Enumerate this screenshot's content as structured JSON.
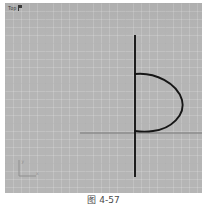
{
  "viewport": {
    "label": "Top",
    "label_marker_icon": "viewport-menu-marker-icon",
    "background_color": "#b5b5b5",
    "grid": {
      "visible": true,
      "minor_spacing_px": 8,
      "major_spacing_px": 40,
      "minor_color": "#c2c2c2",
      "major_color": "#a0a0a0"
    }
  },
  "axis_tripod": {
    "name": "world-axis-tripod",
    "x_axis_label": "x",
    "y_axis_label": "y",
    "color": "#8f8f8f"
  },
  "geometry": {
    "stroke_color": "#161616",
    "axis_line_color": "#8c8c8c",
    "vertical_line": {
      "name": "vertical-axis-line",
      "x": 130,
      "y_top": 32,
      "y_bottom": 174,
      "stroke_width": 1.9
    },
    "horizontal_line": {
      "name": "horizontal-construction-line",
      "y": 130,
      "x_left": 75,
      "x_right": 197,
      "stroke_width": 1.3
    },
    "profile_curve": {
      "name": "revolve-profile-arc",
      "description": "closed D-shaped arc bulging to the right of the axis",
      "anchor_top": {
        "x": 130,
        "y": 71
      },
      "anchor_bottom": {
        "x": 130,
        "y": 128
      },
      "rightmost": {
        "x": 178,
        "y": 98
      },
      "stroke_width": 1.9
    }
  },
  "caption": {
    "text": "图 4-57"
  }
}
